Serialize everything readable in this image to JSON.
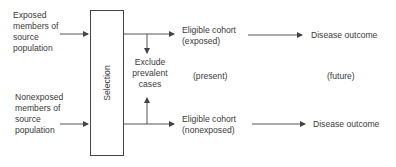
{
  "diagram": {
    "type": "flowchart",
    "sources": {
      "exposed": [
        "Exposed",
        "members of",
        "source",
        "population"
      ],
      "nonexposed": [
        "Nonexposed",
        "members of",
        "source",
        "population"
      ]
    },
    "selection_label": "Selection",
    "exclusion": [
      "Exclude",
      "prevalent",
      "cases"
    ],
    "cohorts": {
      "exposed": [
        "Eligible cohort",
        "(exposed)"
      ],
      "nonexposed": [
        "Eligible cohort",
        "(nonexposed)"
      ]
    },
    "time_labels": {
      "present": "(present)",
      "future": "(future)"
    },
    "outcomes": {
      "exposed": "Disease outcome",
      "nonexposed": "Disease outcome"
    },
    "colors": {
      "line": "#444444",
      "text": "#3a3a3a",
      "background": "#ffffff"
    }
  }
}
